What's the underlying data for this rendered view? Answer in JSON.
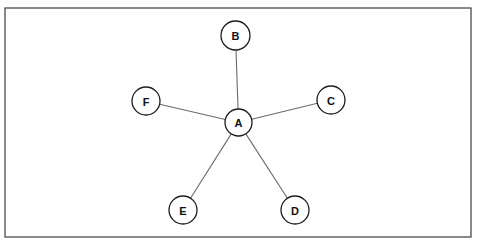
{
  "canvas": {
    "width": 480,
    "height": 247,
    "background_color": "#ffffff"
  },
  "frame": {
    "x": 5,
    "y": 8,
    "width": 466,
    "height": 229,
    "stroke_color": "#3a3a42",
    "fill_color": "#ffffff"
  },
  "diagram": {
    "type": "star-topology-graph",
    "hub_id": "A",
    "node_radius": 14,
    "hub_radius": 13.5,
    "node_stroke_color": "#1c1c20",
    "node_fill_color": "#ffffff",
    "edge_color": "#6a6a72",
    "label_color": "#111115"
  },
  "nodes": [
    {
      "id": "A",
      "label": "A",
      "cx": 238.5,
      "cy": 122.5,
      "r": 13.5,
      "role": "hub"
    },
    {
      "id": "B",
      "label": "B",
      "cx": 235.5,
      "cy": 35.5,
      "r": 14.5,
      "role": "leaf"
    },
    {
      "id": "C",
      "label": "C",
      "cx": 331,
      "cy": 100,
      "r": 14,
      "role": "leaf"
    },
    {
      "id": "D",
      "label": "D",
      "cx": 295,
      "cy": 210,
      "r": 14,
      "role": "leaf"
    },
    {
      "id": "E",
      "label": "E",
      "cx": 183,
      "cy": 210,
      "r": 14,
      "role": "leaf"
    },
    {
      "id": "F",
      "label": "F",
      "cx": 146,
      "cy": 101,
      "r": 14,
      "role": "leaf"
    }
  ],
  "edges": [
    {
      "id": "A-B",
      "from": "A",
      "to": "B"
    },
    {
      "id": "A-C",
      "from": "A",
      "to": "C"
    },
    {
      "id": "A-D",
      "from": "A",
      "to": "D"
    },
    {
      "id": "A-E",
      "from": "A",
      "to": "E"
    },
    {
      "id": "A-F",
      "from": "A",
      "to": "F"
    }
  ]
}
